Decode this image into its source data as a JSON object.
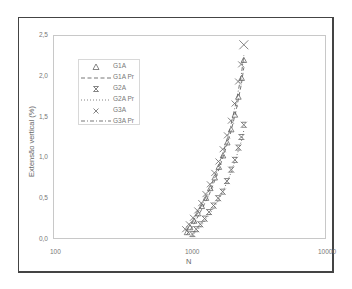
{
  "chart_data": {
    "type": "scatter",
    "title": "",
    "xlabel": "N",
    "ylabel": "Extensão vertical (%)",
    "xscale": "log",
    "xlim": [
      100,
      10000
    ],
    "ylim": [
      0,
      2.5
    ],
    "x_ticks": [
      "100",
      "1000",
      "10000"
    ],
    "y_ticks": [
      "0,0",
      "0,5",
      "1,0",
      "1,5",
      "2,0",
      "2,5"
    ],
    "grid": false,
    "legend_position": "upper-left-inside",
    "legend": [
      "G1A",
      "G1A Pr",
      "G2A",
      "G2A Pr",
      "G3A",
      "G3A Pr"
    ],
    "series": [
      {
        "name": "G1A",
        "marker": "triangle",
        "x": [
          960,
          1010,
          1080,
          1150,
          1230,
          1320,
          1420,
          1530,
          1640,
          1760,
          1890,
          2020,
          2150,
          2280,
          2410,
          2500
        ],
        "y": [
          0.08,
          0.14,
          0.22,
          0.31,
          0.4,
          0.5,
          0.62,
          0.75,
          0.88,
          1.02,
          1.18,
          1.34,
          1.52,
          1.74,
          1.97,
          2.19
        ]
      },
      {
        "name": "G1A Pr",
        "line": "dashed",
        "x": [
          950,
          1050,
          1200,
          1400,
          1600,
          1800,
          2000,
          2200,
          2400,
          2500
        ],
        "y": [
          0.05,
          0.15,
          0.33,
          0.55,
          0.8,
          1.05,
          1.3,
          1.58,
          1.9,
          2.1
        ]
      },
      {
        "name": "G2A",
        "marker": "asterisk",
        "x": [
          1050,
          1120,
          1200,
          1290,
          1390,
          1500,
          1620,
          1750,
          1880,
          2020,
          2150,
          2280,
          2400,
          2500
        ],
        "y": [
          0.06,
          0.12,
          0.18,
          0.25,
          0.33,
          0.41,
          0.5,
          0.58,
          0.71,
          0.85,
          0.97,
          1.12,
          1.25,
          1.4
        ]
      },
      {
        "name": "G2A Pr",
        "line": "dotted",
        "x": [
          1050,
          1200,
          1400,
          1600,
          1800,
          2000,
          2200,
          2400,
          2500
        ],
        "y": [
          0.04,
          0.15,
          0.3,
          0.45,
          0.62,
          0.8,
          1.0,
          1.2,
          1.33
        ]
      },
      {
        "name": "G3A",
        "marker": "x",
        "x": [
          930,
          990,
          1060,
          1140,
          1220,
          1310,
          1410,
          1520,
          1630,
          1750,
          1880,
          2010,
          2140,
          2270,
          2390,
          2500
        ],
        "y": [
          0.12,
          0.18,
          0.26,
          0.35,
          0.44,
          0.55,
          0.67,
          0.81,
          0.95,
          1.1,
          1.27,
          1.45,
          1.66,
          1.93,
          2.14,
          2.38
        ]
      },
      {
        "name": "G3A Pr",
        "line": "dash-dot",
        "x": [
          940,
          1050,
          1200,
          1400,
          1600,
          1800,
          2000,
          2200,
          2400,
          2500
        ],
        "y": [
          0.1,
          0.2,
          0.38,
          0.6,
          0.85,
          1.1,
          1.38,
          1.68,
          2.02,
          2.25
        ]
      }
    ]
  },
  "axes": {
    "y_ticks": [
      "0,0",
      "0,5",
      "1,0",
      "1,5",
      "2,0",
      "2,5"
    ],
    "x_ticks": [
      "100",
      "1000",
      "10000"
    ],
    "xlabel": "N",
    "ylabel": "Extensão vertical (%)"
  },
  "legend": {
    "items": [
      {
        "label": "G1A",
        "symbol": "triangle"
      },
      {
        "label": "G1A Pr",
        "symbol": "dashed-line"
      },
      {
        "label": "G2A",
        "symbol": "asterisk"
      },
      {
        "label": "G2A Pr",
        "symbol": "dotted-line"
      },
      {
        "label": "G3A",
        "symbol": "x"
      },
      {
        "label": "G3A Pr",
        "symbol": "dash-dot-line"
      }
    ]
  },
  "colors": {
    "frame": "#444444",
    "plot_border": "#c8c8c8",
    "marker": "#666666",
    "text": "#777777"
  }
}
